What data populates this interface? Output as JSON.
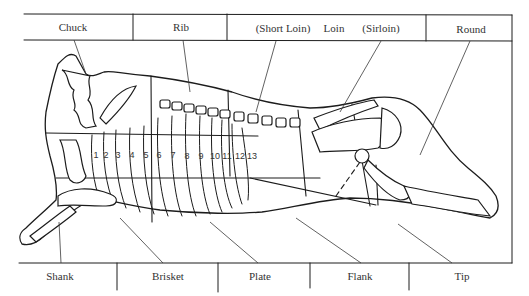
{
  "diagram": {
    "top_labels": [
      {
        "id": "chuck",
        "label": "Chuck"
      },
      {
        "id": "rib",
        "label": "Rib"
      },
      {
        "id": "short-loin",
        "label": "(Short Loin)"
      },
      {
        "id": "loin",
        "label": "Loin"
      },
      {
        "id": "sirloin",
        "label": "(Sirloin)"
      },
      {
        "id": "round",
        "label": "Round"
      }
    ],
    "bottom_labels": [
      {
        "id": "shank",
        "label": "Shank"
      },
      {
        "id": "brisket",
        "label": "Brisket"
      },
      {
        "id": "plate",
        "label": "Plate"
      },
      {
        "id": "flank",
        "label": "Flank"
      },
      {
        "id": "tip",
        "label": "Tip"
      }
    ],
    "rib_numbers": [
      "1",
      "2",
      "3",
      "4",
      "5",
      "6",
      "7",
      "8",
      "9",
      "10",
      "11",
      "12",
      "13"
    ],
    "line_color": "#1c1c1c",
    "background": "#ffffff"
  }
}
